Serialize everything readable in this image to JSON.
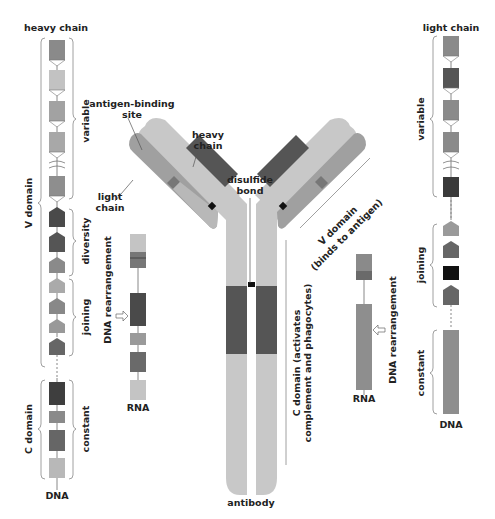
{
  "labels": {
    "heavy_chain_title": "heavy chain",
    "light_chain_title": "light chain",
    "variable_left": "variable",
    "diversity": "diversity",
    "joining_left": "joining",
    "constant_left": "constant",
    "v_domain": "V domain",
    "c_domain": "C domain",
    "dna_left": "DNA",
    "dna_right": "DNA",
    "rna_left": "RNA",
    "rna_right": "RNA",
    "dna_rearrangement_left": "DNA rearrangement",
    "dna_rearrangement_right": "DNA rearrangement",
    "variable_right": "variable",
    "joining_right": "joining",
    "constant_right": "constant",
    "antigen_binding_site_1": "antigen-binding",
    "antigen_binding_site_2": "site",
    "heavy_chain_1": "heavy",
    "heavy_chain_2": "chain",
    "light_chain_1": "light",
    "light_chain_2": "chain",
    "disulfide_1": "disulfide",
    "disulfide_2": "bond",
    "v_domain_binds_1": "V domain",
    "v_domain_binds_2": "(binds to antigen)",
    "c_domain_activates_1": "C domain (activates",
    "c_domain_activates_2": "complement and phagocytes)",
    "antibody": "antibody"
  },
  "colors": {
    "light_gray": "#c8c8c8",
    "mid_gray": "#9a9a9a",
    "dark_gray": "#6a6a6a",
    "darker_gray": "#555555",
    "black": "#111111"
  }
}
